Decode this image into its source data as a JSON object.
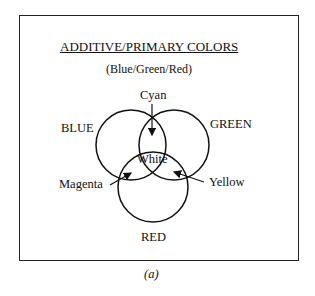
{
  "diagram": {
    "title": "ADDITIVE/PRIMARY COLORS",
    "subtitle": "(Blue/Green/Red)",
    "circles": [
      {
        "label": "BLUE",
        "cx": 131,
        "cy": 145,
        "r": 35
      },
      {
        "label": "GREEN",
        "cx": 174,
        "cy": 145,
        "r": 35
      },
      {
        "label": "RED",
        "cx": 153,
        "cy": 187,
        "r": 35
      }
    ],
    "overlaps": {
      "cyan": "Cyan",
      "white": "White",
      "magenta": "Magenta",
      "yellow": "Yellow"
    },
    "labels": {
      "blue": "BLUE",
      "green": "GREEN",
      "red": "RED"
    }
  },
  "caption": "(a)"
}
